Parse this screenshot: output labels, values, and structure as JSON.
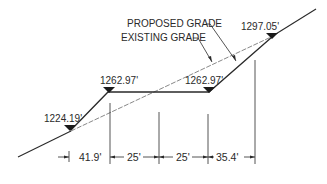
{
  "diagram": {
    "type": "grading-cross-section",
    "labels": {
      "proposed_grade": "PROPOSED GRADE",
      "existing_grade": "EXISTING GRADE"
    },
    "elevations": [
      {
        "id": "lower",
        "value": "1224.19'"
      },
      {
        "id": "bench-left",
        "value": "1262.97'"
      },
      {
        "id": "bench-right",
        "value": "1262.97'"
      },
      {
        "id": "upper",
        "value": "1297.05'"
      }
    ],
    "dimensions": [
      {
        "id": "slope-1",
        "value": "41.9'"
      },
      {
        "id": "bench-1",
        "value": "25'"
      },
      {
        "id": "bench-2",
        "value": "25'"
      },
      {
        "id": "slope-2",
        "value": "35.4'"
      }
    ],
    "colors": {
      "line": "#2a2a2a",
      "background": "#ffffff"
    }
  }
}
